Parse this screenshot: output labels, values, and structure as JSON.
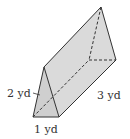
{
  "figure": {
    "type": "triangular-prism",
    "colors": {
      "fill_front": "#d0d0d0",
      "fill_side": "#dcdcdc",
      "fill_top": "#e4e4e4",
      "stroke": "#333333",
      "label": "#333333"
    }
  },
  "labels": {
    "edge_2": "2 yd",
    "length": "3 yd",
    "base": "1 yd"
  }
}
